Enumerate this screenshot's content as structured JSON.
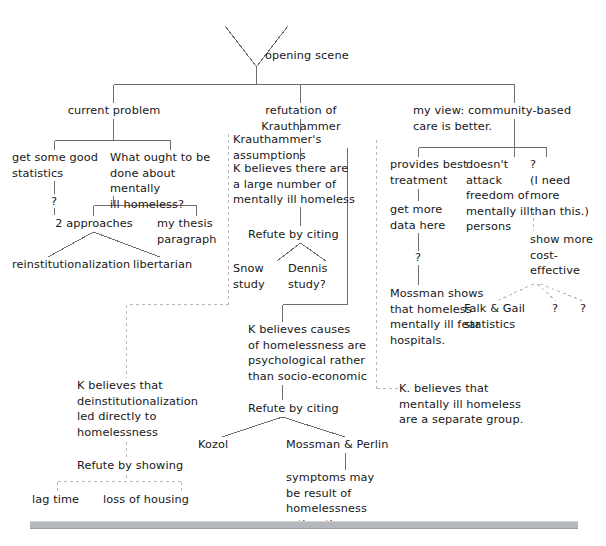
{
  "diagram": {
    "style": {
      "solid_line_color": "#6f6f6f",
      "dashed_line_color": "#b9b9b9",
      "text_color": "#171717",
      "footer_bar_color": "#b4b7bb",
      "background": "#ffffff"
    },
    "root": {
      "label": "opening scene"
    },
    "branches": [
      {
        "id": "current-problem",
        "label": "current problem",
        "children": [
          {
            "id": "get-some-good-statistics",
            "label": "get some good\nstatistics",
            "children": [
              {
                "id": "stats-question",
                "label": "?"
              }
            ]
          },
          {
            "id": "what-ought-to-be-done",
            "label": "What ought to be\ndone about mentally\nill homeless?",
            "children": [
              {
                "id": "two-approaches",
                "label": "2 approaches",
                "children": [
                  {
                    "id": "reinstitutionalization",
                    "label": "reinstitutionalization"
                  },
                  {
                    "id": "libertarian",
                    "label": "libertarian"
                  }
                ]
              },
              {
                "id": "my-thesis-paragraph",
                "label": "my thesis\nparagraph"
              }
            ]
          }
        ]
      },
      {
        "id": "refutation-of-krauthammer",
        "label": "refutation of Krauthammer",
        "children": [
          {
            "id": "krauthammers-assumptions",
            "label": "Krauthammer's assumptions",
            "children": [
              {
                "id": "k-believes-large-number",
                "label": "K believes there are\na large number of\nmentally ill homeless",
                "children": [
                  {
                    "id": "refute-by-citing-1",
                    "label": "Refute by citing",
                    "children": [
                      {
                        "id": "snow-study",
                        "label": "Snow\nstudy"
                      },
                      {
                        "id": "dennis-study",
                        "label": "Dennis\nstudy?"
                      }
                    ]
                  }
                ]
              },
              {
                "id": "k-believes-deinstitutionalization",
                "label": "K believes that\ndeinstitutionalization\nled directly to\nhomelessness",
                "children": [
                  {
                    "id": "refute-by-showing",
                    "label": "Refute by showing",
                    "children": [
                      {
                        "id": "lag-time",
                        "label": "lag time"
                      },
                      {
                        "id": "loss-of-housing",
                        "label": "loss of housing"
                      }
                    ]
                  }
                ]
              },
              {
                "id": "k-believes-causes-psychological",
                "label": "K believes causes\nof homelessness are\npsychological rather\nthan socio-economic",
                "children": [
                  {
                    "id": "refute-by-citing-2",
                    "label": "Refute by citing",
                    "children": [
                      {
                        "id": "kozol",
                        "label": "Kozol"
                      },
                      {
                        "id": "mossman-and-perlin",
                        "label": "Mossman & Perlin",
                        "children": [
                          {
                            "id": "symptoms-may-be-result",
                            "label": "symptoms may\nbe result of\nhomelessness\nrather than cause"
                          }
                        ]
                      }
                    ]
                  }
                ]
              },
              {
                "id": "k-believes-separate-group",
                "label": "K. believes that\nmentally ill homeless\nare a separate group."
              }
            ]
          }
        ]
      },
      {
        "id": "my-view-community-based",
        "label": "my view: community-based\ncare is better.",
        "children": [
          {
            "id": "provides-best-treatment",
            "label": "provides best\ntreatment",
            "children": [
              {
                "id": "get-more-data-here",
                "label": "get more\ndata here",
                "children": [
                  {
                    "id": "treatment-question",
                    "label": "?",
                    "children": [
                      {
                        "id": "mossman-shows",
                        "label": "Mossman shows\nthat homeless\nmentally ill fear\nhospitals."
                      }
                    ]
                  }
                ]
              }
            ]
          },
          {
            "id": "doesnt-attack-freedom",
            "label": "doesn't\nattack\nfreedom of\nmentally ill\npersons"
          },
          {
            "id": "need-more-than-this",
            "label": "?\n(I need\nmore\nthan this.)",
            "children": [
              {
                "id": "show-more-cost-effective",
                "label": "show more\ncost-\neffective",
                "children": [
                  {
                    "id": "falk-and-gail-statistics",
                    "label": "Falk & Gail\nstatistics"
                  },
                  {
                    "id": "cost-question-1",
                    "label": "?"
                  },
                  {
                    "id": "cost-question-2",
                    "label": "?"
                  }
                ]
              }
            ]
          }
        ]
      }
    ]
  }
}
